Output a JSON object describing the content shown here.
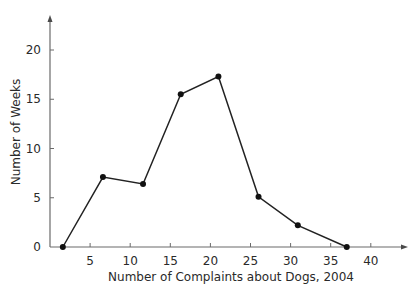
{
  "chart_data": {
    "type": "line",
    "title": "",
    "xlabel": "Number of Complaints about Dogs, 2004",
    "ylabel": "Number of Weeks",
    "xlim": [
      0,
      44
    ],
    "ylim": [
      0,
      23
    ],
    "x_ticks": [
      5,
      10,
      15,
      20,
      25,
      30,
      35,
      40
    ],
    "y_ticks": [
      0,
      5,
      10,
      15,
      20
    ],
    "grid": false,
    "legend": "none",
    "series": [
      {
        "name": "Frequency polygon",
        "x": [
          1.6,
          6.6,
          11.6,
          16.3,
          21,
          26,
          30.9,
          37
        ],
        "y": [
          0,
          7.1,
          6.4,
          15.5,
          17.3,
          5.1,
          2.2,
          0
        ],
        "color": "#222222",
        "markers": true
      }
    ]
  }
}
